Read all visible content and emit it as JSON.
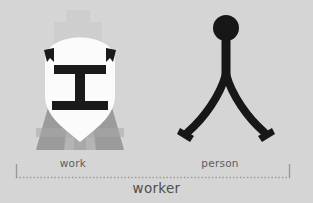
{
  "figure": {
    "background_color": "#d5d5d5",
    "ink_color": "#1a1a1a",
    "label_color": "#5d5d5d",
    "compound_label_color": "#4e4e4e",
    "bracket_color": "#9a9a9a"
  },
  "components": [
    {
      "id": "work",
      "label": "work",
      "character": "工",
      "illustration": "hard-hat-worker-with-i-beam-face",
      "colors": {
        "helmet": "#fbfbfb",
        "beam": "#1a1a1a",
        "body_light": "#b4b4b4",
        "body_mid": "#9b9b9b",
        "body_dark": "#8a8a8a"
      }
    },
    {
      "id": "person",
      "label": "person",
      "character": "人",
      "illustration": "stick-figure-walking-person",
      "colors": {
        "ink": "#171717"
      }
    }
  ],
  "compound": {
    "label": "worker",
    "character": "工人"
  },
  "bracket": {
    "style": "dotted-underline-with-end-ticks",
    "left_tick_x": 16,
    "right_tick_x": 290
  }
}
